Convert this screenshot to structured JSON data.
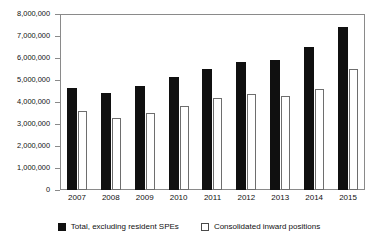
{
  "chart_data": {
    "type": "bar",
    "title": "",
    "subtitle": "",
    "xlabel": "",
    "ylabel": "",
    "categories": [
      "2007",
      "2008",
      "2009",
      "2010",
      "2011",
      "2012",
      "2013",
      "2014",
      "2015"
    ],
    "series": [
      {
        "name": "Total, excluding resident SPEs",
        "color": "#101010",
        "style": "filled",
        "values": [
          4640000,
          4400000,
          4720000,
          5150000,
          5520000,
          5800000,
          5900000,
          6480000,
          7390000
        ]
      },
      {
        "name": "Consolidated inward positions",
        "color": "#ffffff",
        "style": "outlined",
        "values": [
          3580000,
          3270000,
          3500000,
          3800000,
          4170000,
          4360000,
          4280000,
          4580000,
          5480000
        ]
      }
    ],
    "ylim": [
      0,
      8000000
    ],
    "ytick_values": [
      0,
      1000000,
      2000000,
      3000000,
      4000000,
      5000000,
      6000000,
      7000000,
      8000000
    ],
    "ytick_labels": [
      "0",
      "1,000,000",
      "2,000,000",
      "3,000,000",
      "4,000,000",
      "5,000,000",
      "6,000,000",
      "7,000,000",
      "8,000,000"
    ],
    "grid": false,
    "legend_position": "bottom",
    "legend_entries": [
      "Total, excluding resident SPEs",
      "Consolidated inward positions"
    ]
  }
}
